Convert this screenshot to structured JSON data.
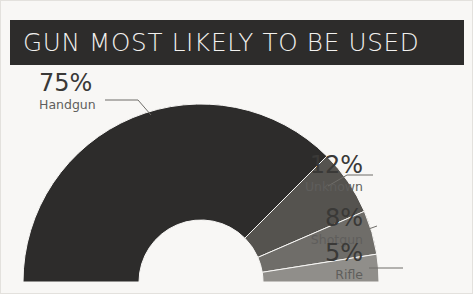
{
  "header": {
    "title": "GUN MOST LIKELY TO BE USED",
    "bar_color": "#2d2c2b",
    "text_color": "#f2f1ef"
  },
  "background_color": "#f8f7f5",
  "chart_data": {
    "type": "pie",
    "variant": "semi-donut",
    "title": "GUN MOST LIKELY TO BE USED",
    "subtitle": "",
    "xlabel": "",
    "ylabel": "",
    "units": "percent",
    "total": 100,
    "legend_position": "callout-labels",
    "grid": false,
    "categories": [
      "Handgun",
      "Unknown",
      "Shotgun",
      "Rifle"
    ],
    "values": [
      75,
      12,
      8,
      5
    ],
    "value_labels": [
      "75%",
      "12%",
      "8%",
      "5%"
    ],
    "colors": [
      "#2d2c2b",
      "#55534f",
      "#6f6d69",
      "#908e8a"
    ],
    "slices": [
      {
        "label": "Handgun",
        "value": 75,
        "value_label": "75%",
        "color": "#2d2c2b"
      },
      {
        "label": "Unknown",
        "value": 12,
        "value_label": "12%",
        "color": "#55534f"
      },
      {
        "label": "Shotgun",
        "value": 8,
        "value_label": "8%",
        "color": "#6f6d69"
      },
      {
        "label": "Rifle",
        "value": 5,
        "value_label": "5%",
        "color": "#908e8a"
      }
    ]
  },
  "labels": {
    "handgun": {
      "percent": "75%",
      "category": "Handgun"
    },
    "unknown": {
      "percent": "12%",
      "category": "Unknown"
    },
    "shotgun": {
      "percent": "8%",
      "category": "Shotgun"
    },
    "rifle": {
      "percent": "5%",
      "category": "Rifle"
    }
  }
}
